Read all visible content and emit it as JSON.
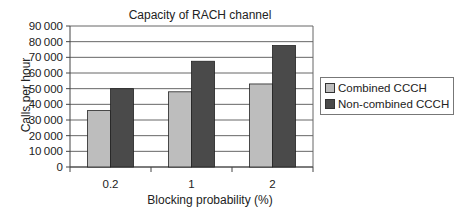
{
  "chart_data": {
    "type": "bar",
    "title": "Capacity of RACH channel",
    "xlabel": "Blocking probability (%)",
    "ylabel": "Calls per hour",
    "categories": [
      "0.2",
      "1",
      "2"
    ],
    "series": [
      {
        "name": "Combined CCCH",
        "color": "#bdbdbd",
        "values": [
          36000,
          48000,
          53000
        ]
      },
      {
        "name": "Non-combined CCCH",
        "color": "#4a4a4a",
        "values": [
          50000,
          67500,
          77500
        ]
      }
    ],
    "ylim": [
      0,
      90000
    ],
    "yticks": [
      "0",
      "10000",
      "20000",
      "30000",
      "40000",
      "50000",
      "60000",
      "70000",
      "80000",
      "90000"
    ],
    "grid": true,
    "legend_position": "right"
  }
}
